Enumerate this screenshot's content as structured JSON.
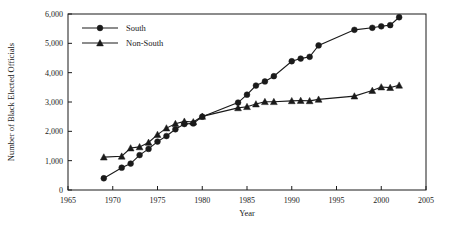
{
  "chart_data": {
    "type": "line",
    "title": "",
    "xlabel": "Year",
    "ylabel": "Number of Black Elected Officials",
    "xlim": [
      1965,
      2005
    ],
    "ylim": [
      0,
      6000
    ],
    "xticks": [
      1965,
      1970,
      1975,
      1980,
      1985,
      1990,
      1995,
      2000,
      2005
    ],
    "xtick_labels": [
      "1965",
      "1970",
      "1975",
      "1980",
      "1985",
      "1990",
      "1995",
      "2000",
      "2005"
    ],
    "yticks": [
      0,
      1000,
      2000,
      3000,
      4000,
      5000,
      6000
    ],
    "ytick_labels": [
      "0",
      "1,000",
      "2,000",
      "3,000",
      "4,000",
      "5,000",
      "6,000"
    ],
    "grid": false,
    "legend_position": "top-left",
    "series": [
      {
        "name": "South",
        "marker": "circle",
        "x": [
          1969,
          1971,
          1972,
          1973,
          1974,
          1975,
          1976,
          1977,
          1978,
          1979,
          1980,
          1984,
          1985,
          1986,
          1987,
          1988,
          1990,
          1991,
          1992,
          1993,
          1997,
          1999,
          2000,
          2001,
          2002
        ],
        "values": [
          400,
          760,
          900,
          1190,
          1400,
          1650,
          1840,
          2070,
          2250,
          2270,
          2500,
          2980,
          3250,
          3560,
          3700,
          3880,
          4390,
          4480,
          4540,
          4930,
          5460,
          5530,
          5580,
          5620,
          5890
        ]
      },
      {
        "name": "Non-South",
        "marker": "triangle",
        "x": [
          1969,
          1971,
          1972,
          1973,
          1974,
          1975,
          1976,
          1977,
          1978,
          1979,
          1980,
          1984,
          1985,
          1986,
          1987,
          1988,
          1990,
          1991,
          1992,
          1993,
          1997,
          1999,
          2000,
          2001,
          2002
        ],
        "values": [
          1120,
          1150,
          1430,
          1470,
          1620,
          1890,
          2110,
          2260,
          2340,
          2320,
          2510,
          2800,
          2840,
          2930,
          3010,
          3010,
          3040,
          3050,
          3040,
          3090,
          3200,
          3390,
          3510,
          3490,
          3570
        ]
      }
    ]
  },
  "legend": {
    "items": [
      {
        "label": "South"
      },
      {
        "label": "Non-South"
      }
    ]
  }
}
